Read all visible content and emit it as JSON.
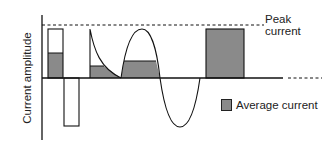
{
  "diagram": {
    "y_axis_label": "Current amplitude",
    "peak_label_line1": "Peak",
    "peak_label_line2": "current",
    "legend": {
      "label": "Average current",
      "swatch_color": "#8a8a8a"
    },
    "colors": {
      "stroke": "#111111",
      "fill_average": "#8a8a8a",
      "background": "#ffffff"
    },
    "waveforms": [
      {
        "name": "biphasic-pulse",
        "positive_peak": 1.0,
        "negative_peak": -1.0,
        "average": 0.5
      },
      {
        "name": "exponential-decay",
        "peak": 1.0,
        "average": 0.25
      },
      {
        "name": "sine-wave",
        "peak": 1.0,
        "trough": -1.0,
        "average_positive_half": 0.35
      },
      {
        "name": "dc-constant",
        "peak": 1.0,
        "average": 1.0
      }
    ]
  }
}
